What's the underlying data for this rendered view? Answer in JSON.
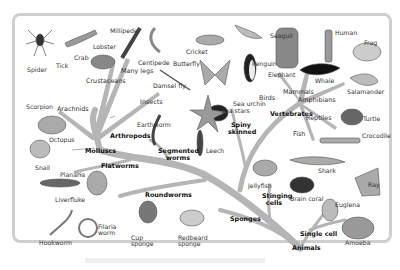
{
  "diagram": {
    "colors": {
      "branch": "#b5b5b5",
      "frame": "#cfcfcf",
      "animal": "#777777",
      "label": "#333333"
    },
    "root": "Animals",
    "groups": {
      "arthropods": "Arthropods",
      "molluscs": "Molluscs",
      "flatworms": "Flatworms",
      "roundworms": "Roundworms",
      "segmented_worms": "Segmented worms",
      "spiny_skinned": "Spiny skinned",
      "vertebrates": "Vertebrates",
      "sponges": "Sponges",
      "stinging_cells": "Stinging cells",
      "single_cell": "Single cell",
      "arachnids": "Arachnids",
      "crustaceans": "Crustaceans",
      "many_legs": "Many legs",
      "insects": "Insects",
      "mammals": "Mammals",
      "amphibians": "Amphibians",
      "reptiles": "Reptiles",
      "fish": "Fish",
      "birds": "Birds"
    },
    "animals": {
      "spider": "Spider",
      "tick": "Tick",
      "scorpion": "Scorpion",
      "lobster": "Lobster",
      "crab": "Crab",
      "millipede": "Millipede",
      "centipede": "Centipede",
      "cricket": "Cricket",
      "butterfly": "Butterfly",
      "damsel_fly": "Damsel fly",
      "seagull": "Seagull",
      "penguin": "Penguin",
      "elephant": "Elephant",
      "whale": "Whale",
      "human": "Human",
      "frog": "Frog",
      "salamander": "Salamander",
      "turtle": "Turtle",
      "crocodile": "Crocodile",
      "shark": "Shark",
      "ray": "Ray",
      "sea_urchin": "Sea urchin",
      "sea_stars": "Sea stars",
      "earthworm": "Earthworm",
      "leech": "Leech",
      "octopus": "Octopus",
      "snail": "Snail",
      "planaria": "Planaria",
      "liverfluke": "Liverfluke",
      "hookworm": "Hookworm",
      "filaria_worm": "Filaria worm",
      "cup_sponge": "Cup sponge",
      "redbeard_sponge": "Redbeard sponge",
      "jellyfish": "Jellyfish",
      "brain_coral": "Brain coral",
      "euglena": "Euglena",
      "amoeba": "Amoeba"
    }
  }
}
